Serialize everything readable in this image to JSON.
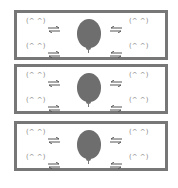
{
  "panels": [
    {
      "faces": {
        "tl": "(^ ^)",
        "bl": "(^ ^)",
        "tr": "(^ ^)",
        "br": "(^ ^)"
      }
    },
    {
      "faces": {
        "tl": "(^ ^)",
        "bl": "(^ ^)",
        "tr": "(^ ^)",
        "br": "(^ ^)"
      }
    },
    {
      "faces": {
        "tl": "(^ ^)",
        "bl": "(^ ^)",
        "tr": "(^ ^)",
        "br": "(^ ^)"
      }
    }
  ],
  "colors": {
    "border": "#777777",
    "balloon": "#6e6e6e",
    "text": "#8a8a8a"
  }
}
